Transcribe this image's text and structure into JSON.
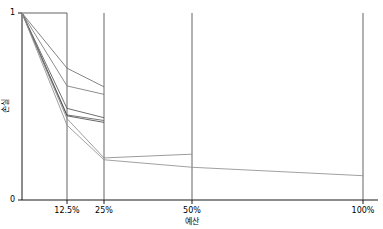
{
  "chart_data": {
    "type": "line",
    "title": "",
    "subtitle": "",
    "xlabel": "예산",
    "ylabel": "손실",
    "xticks": [
      "12.5%",
      "25%",
      "50%",
      "100%"
    ],
    "xtick_values": [
      12.5,
      25,
      50,
      100
    ],
    "yticks": [
      "0",
      "1"
    ],
    "ytick_values": [
      0,
      1
    ],
    "xlim": [
      0,
      100
    ],
    "ylim": [
      0,
      1
    ],
    "x_scale": "log2-like-bracket",
    "grid": "vertical-only",
    "legend": "none",
    "x": [
      0,
      12.5,
      25,
      50,
      100
    ],
    "series": [
      {
        "name": "run-1",
        "color": "#6e6e6e",
        "values": [
          1.0,
          0.705,
          0.605,
          null,
          null
        ]
      },
      {
        "name": "run-2",
        "color": "#7a7a7a",
        "values": [
          1.0,
          0.61,
          0.565,
          null,
          null
        ]
      },
      {
        "name": "run-3",
        "color": "#555555",
        "values": [
          1.0,
          0.49,
          0.44,
          null,
          null
        ]
      },
      {
        "name": "run-4",
        "color": "#606060",
        "values": [
          1.0,
          0.455,
          0.425,
          null,
          null
        ]
      },
      {
        "name": "run-5",
        "color": "#4a4a4a",
        "values": [
          1.0,
          0.45,
          0.415,
          null,
          null
        ]
      },
      {
        "name": "run-6",
        "color": "#8a8a8a",
        "values": [
          1.0,
          0.435,
          0.225,
          0.245,
          null
        ]
      },
      {
        "name": "run-7",
        "color": "#909090",
        "values": [
          1.0,
          0.4,
          0.215,
          0.175,
          0.13
        ]
      }
    ],
    "annotations": [
      {
        "name": "top-bracket",
        "description": "horizontal rule at y=1 spanning x=0 to x=12.5%"
      }
    ]
  },
  "figure": {
    "background_color": "#ffffff",
    "axis_color": "#000000",
    "gridline_color": "#3c3c3c"
  }
}
